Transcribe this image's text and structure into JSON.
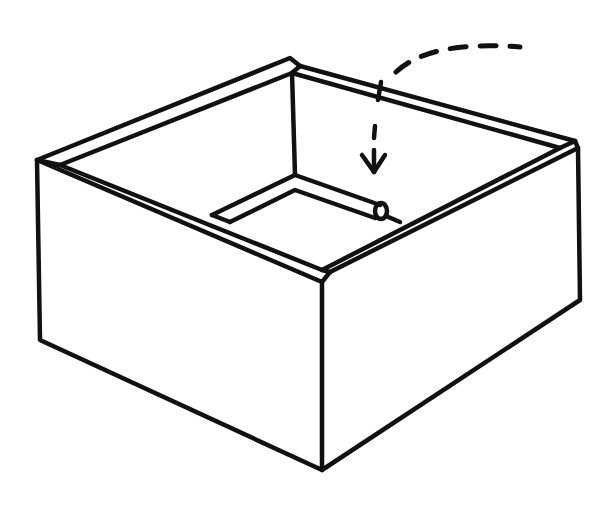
{
  "figure": {
    "title": "Open box line drawing",
    "colors": {
      "ink": "#111111",
      "background": "#ffffff"
    },
    "elements": [
      {
        "id": "box-front-face",
        "label": "Box front-left face"
      },
      {
        "id": "box-right-face",
        "label": "Box front-right face"
      },
      {
        "id": "box-rim",
        "label": "Top rim"
      },
      {
        "id": "inner-flap",
        "label": "Inner bottom flap"
      },
      {
        "id": "dashed-arrow",
        "label": "Dashed arrow pointing into box"
      }
    ]
  }
}
